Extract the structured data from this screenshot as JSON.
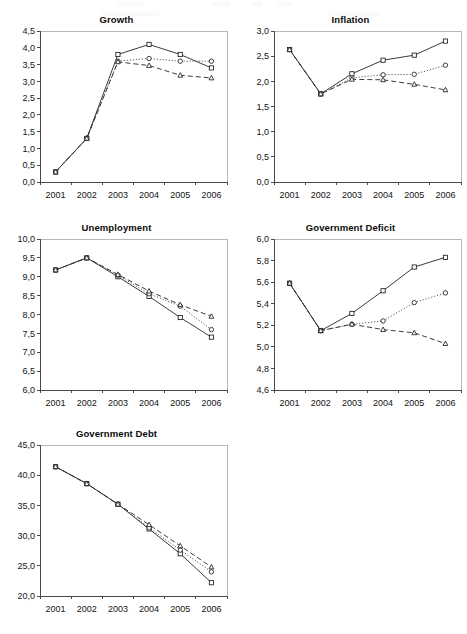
{
  "figure": {
    "background_color": "#ffffff",
    "ink_color": "#262626",
    "panel_count": 5,
    "x_categories": [
      "2001",
      "2002",
      "2003",
      "2004",
      "2005",
      "2006"
    ],
    "series_names": [
      "square-series",
      "circle-series",
      "triangle-series"
    ],
    "series_markers": [
      "square",
      "circle",
      "triangle"
    ],
    "series_linestyles": [
      "solid",
      "dotted",
      "dashed"
    ]
  },
  "chart_data": [
    {
      "type": "line",
      "title": "Growth",
      "xlabel": "",
      "ylabel": "",
      "x": [
        "2001",
        "2002",
        "2003",
        "2004",
        "2005",
        "2006"
      ],
      "categories": [
        "2001",
        "2002",
        "2003",
        "2004",
        "2005",
        "2006"
      ],
      "ylim": [
        0.0,
        4.5
      ],
      "ytick_values": [
        0.0,
        0.5,
        1.0,
        1.5,
        2.0,
        2.5,
        3.0,
        3.5,
        4.0,
        4.5
      ],
      "ytick_labels": [
        "0,0",
        "0,5",
        "1,0",
        "1,5",
        "2,0",
        "2,5",
        "3,0",
        "3,5",
        "4,0",
        "4,5"
      ],
      "xtick_labels": [
        "2001",
        "2002",
        "2003",
        "2004",
        "2005",
        "2006"
      ],
      "grid": false,
      "legend": "none",
      "series": [
        {
          "name": "square-series",
          "marker": "square",
          "linestyle": "solid",
          "values": [
            0.3,
            1.3,
            3.8,
            4.1,
            3.8,
            3.4
          ]
        },
        {
          "name": "circle-series",
          "marker": "circle",
          "linestyle": "dotted",
          "values": [
            0.3,
            1.3,
            3.6,
            3.68,
            3.6,
            3.6
          ]
        },
        {
          "name": "triangle-series",
          "marker": "triangle",
          "linestyle": "dashed",
          "values": [
            0.3,
            1.3,
            3.58,
            3.47,
            3.18,
            3.1
          ]
        }
      ]
    },
    {
      "type": "line",
      "title": "Inflation",
      "xlabel": "",
      "ylabel": "",
      "x": [
        "2001",
        "2002",
        "2003",
        "2004",
        "2005",
        "2006"
      ],
      "categories": [
        "2001",
        "2002",
        "2003",
        "2004",
        "2005",
        "2006"
      ],
      "ylim": [
        0.0,
        3.0
      ],
      "ytick_values": [
        0.0,
        0.5,
        1.0,
        1.5,
        2.0,
        2.5,
        3.0
      ],
      "ytick_labels": [
        "0,0",
        "0,5",
        "1,0",
        "1,5",
        "2,0",
        "2,5",
        "3,0"
      ],
      "xtick_labels": [
        "2001",
        "2002",
        "2003",
        "2004",
        "2005",
        "2006"
      ],
      "grid": false,
      "legend": "none",
      "series": [
        {
          "name": "square-series",
          "marker": "square",
          "linestyle": "solid",
          "values": [
            2.63,
            1.75,
            2.15,
            2.42,
            2.52,
            2.8
          ]
        },
        {
          "name": "circle-series",
          "marker": "circle",
          "linestyle": "dotted",
          "values": [
            2.63,
            1.75,
            2.07,
            2.13,
            2.14,
            2.32
          ]
        },
        {
          "name": "triangle-series",
          "marker": "triangle",
          "linestyle": "dashed",
          "values": [
            2.63,
            1.75,
            2.04,
            2.03,
            1.94,
            1.83
          ]
        }
      ]
    },
    {
      "type": "line",
      "title": "Unemployment",
      "xlabel": "",
      "ylabel": "",
      "x": [
        "2001",
        "2002",
        "2003",
        "2004",
        "2005",
        "2006"
      ],
      "categories": [
        "2001",
        "2002",
        "2003",
        "2004",
        "2005",
        "2006"
      ],
      "ylim": [
        6.0,
        10.0
      ],
      "ytick_values": [
        6.0,
        6.5,
        7.0,
        7.5,
        8.0,
        8.5,
        9.0,
        9.5,
        10.0
      ],
      "ytick_labels": [
        "6,0",
        "6,5",
        "7,0",
        "7,5",
        "8,0",
        "8,5",
        "9,0",
        "9,5",
        "10,0"
      ],
      "xtick_labels": [
        "2001",
        "2002",
        "2003",
        "2004",
        "2005",
        "2006"
      ],
      "grid": false,
      "legend": "none",
      "series": [
        {
          "name": "square-series",
          "marker": "square",
          "linestyle": "solid",
          "values": [
            9.18,
            9.5,
            9.0,
            8.48,
            7.92,
            7.4
          ]
        },
        {
          "name": "circle-series",
          "marker": "circle",
          "linestyle": "dotted",
          "values": [
            9.18,
            9.5,
            9.04,
            8.55,
            8.22,
            7.6
          ]
        },
        {
          "name": "triangle-series",
          "marker": "triangle",
          "linestyle": "dashed",
          "values": [
            9.18,
            9.5,
            9.06,
            8.62,
            8.26,
            7.95
          ]
        }
      ]
    },
    {
      "type": "line",
      "title": "Government Deficit",
      "xlabel": "",
      "ylabel": "",
      "x": [
        "2001",
        "2002",
        "2003",
        "2004",
        "2005",
        "2006"
      ],
      "categories": [
        "2001",
        "2002",
        "2003",
        "2004",
        "2005",
        "2006"
      ],
      "ylim": [
        4.6,
        6.0
      ],
      "ytick_values": [
        4.6,
        4.8,
        5.0,
        5.2,
        5.4,
        5.6,
        5.8,
        6.0
      ],
      "ytick_labels": [
        "4,6",
        "4,8",
        "5,0",
        "5,2",
        "5,4",
        "5,6",
        "5,8",
        "6,0"
      ],
      "xtick_labels": [
        "2001",
        "2002",
        "2003",
        "2004",
        "2005",
        "2006"
      ],
      "grid": false,
      "legend": "none",
      "series": [
        {
          "name": "square-series",
          "marker": "square",
          "linestyle": "solid",
          "values": [
            5.59,
            5.15,
            5.31,
            5.52,
            5.74,
            5.83
          ]
        },
        {
          "name": "circle-series",
          "marker": "circle",
          "linestyle": "dotted",
          "values": [
            5.59,
            5.15,
            5.21,
            5.24,
            5.41,
            5.5
          ]
        },
        {
          "name": "triangle-series",
          "marker": "triangle",
          "linestyle": "dashed",
          "values": [
            5.59,
            5.15,
            5.21,
            5.16,
            5.13,
            5.03
          ]
        }
      ]
    },
    {
      "type": "line",
      "title": "Government Debt",
      "xlabel": "",
      "ylabel": "",
      "x": [
        "2001",
        "2002",
        "2003",
        "2004",
        "2005",
        "2006"
      ],
      "categories": [
        "2001",
        "2002",
        "2003",
        "2004",
        "2005",
        "2006"
      ],
      "ylim": [
        20.0,
        45.0
      ],
      "ytick_values": [
        20.0,
        25.0,
        30.0,
        35.0,
        40.0,
        45.0
      ],
      "ytick_labels": [
        "20,0",
        "25,0",
        "30,0",
        "35,0",
        "40,0",
        "45,0"
      ],
      "xtick_labels": [
        "2001",
        "2002",
        "2003",
        "2004",
        "2005",
        "2006"
      ],
      "grid": false,
      "legend": "none",
      "series": [
        {
          "name": "square-series",
          "marker": "square",
          "linestyle": "solid",
          "values": [
            41.4,
            38.6,
            35.2,
            31.1,
            27.0,
            22.2
          ]
        },
        {
          "name": "circle-series",
          "marker": "circle",
          "linestyle": "dotted",
          "values": [
            41.4,
            38.6,
            35.2,
            31.3,
            27.6,
            24.0
          ]
        },
        {
          "name": "triangle-series",
          "marker": "triangle",
          "linestyle": "dashed",
          "values": [
            41.4,
            38.6,
            35.2,
            31.8,
            28.3,
            24.8
          ]
        }
      ]
    }
  ]
}
